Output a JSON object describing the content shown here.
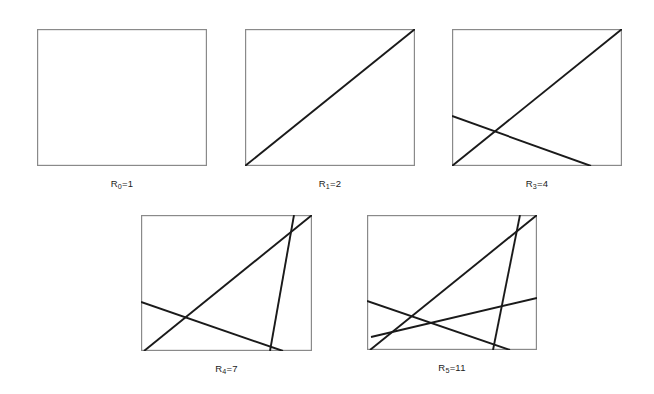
{
  "figure": {
    "background_color": "#ffffff",
    "box_border_color": "#8a8a8a",
    "line_color": "#1a1a1a",
    "caption_color": "#1b1b1b"
  },
  "chart_data": {
    "type": "diagram",
    "panels": [
      {
        "id": "panel-0",
        "caption_prefix": "R",
        "caption_subscript": "0",
        "caption_suffix": "=1",
        "caption_text": "R0=1",
        "n_lines": 0,
        "regions": 1,
        "box": {
          "x": 37,
          "y": 29,
          "width": 170,
          "height": 137
        },
        "lines": []
      },
      {
        "id": "panel-1",
        "caption_prefix": "R",
        "caption_subscript": "1",
        "caption_suffix": "=2",
        "caption_text": "R1=2",
        "n_lines": 1,
        "regions": 2,
        "box": {
          "x": 245,
          "y": 29,
          "width": 170,
          "height": 137
        },
        "lines": [
          {
            "x1": 0,
            "y1": 137,
            "x2": 170,
            "y2": 0
          }
        ]
      },
      {
        "id": "panel-3",
        "caption_prefix": "R",
        "caption_subscript": "3",
        "caption_suffix": "=4",
        "caption_text": "R3=4",
        "n_lines": 2,
        "regions": 4,
        "box": {
          "x": 452,
          "y": 29,
          "width": 170,
          "height": 137
        },
        "lines": [
          {
            "x1": 0,
            "y1": 137,
            "x2": 170,
            "y2": 0
          },
          {
            "x1": 0,
            "y1": 87,
            "x2": 139,
            "y2": 137
          }
        ]
      },
      {
        "id": "panel-4",
        "caption_prefix": "R",
        "caption_subscript": "4",
        "caption_suffix": "=7",
        "caption_text": "R4=7",
        "n_lines": 3,
        "regions": 7,
        "box": {
          "x": 141,
          "y": 215,
          "width": 171,
          "height": 136
        },
        "lines": [
          {
            "x1": 3,
            "y1": 136,
            "x2": 171,
            "y2": 0
          },
          {
            "x1": 0,
            "y1": 87,
            "x2": 142,
            "y2": 136
          },
          {
            "x1": 129,
            "y1": 136,
            "x2": 153,
            "y2": 0
          }
        ]
      },
      {
        "id": "panel-5",
        "caption_prefix": "R",
        "caption_subscript": "5",
        "caption_suffix": "=11",
        "caption_text": "R5=11",
        "n_lines": 4,
        "regions": 11,
        "box": {
          "x": 367,
          "y": 215,
          "width": 170,
          "height": 135
        },
        "lines": [
          {
            "x1": 3,
            "y1": 135,
            "x2": 170,
            "y2": 0
          },
          {
            "x1": 0,
            "y1": 86,
            "x2": 143,
            "y2": 135
          },
          {
            "x1": 126,
            "y1": 135,
            "x2": 153,
            "y2": 0
          },
          {
            "x1": 4,
            "y1": 122,
            "x2": 170,
            "y2": 83
          }
        ]
      }
    ]
  }
}
